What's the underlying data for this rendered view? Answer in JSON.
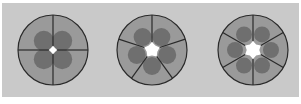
{
  "figure": {
    "panels": [
      {
        "label": "4-cell arrangement",
        "segments": 4,
        "cx": 53,
        "cy": 50,
        "r": 35,
        "lumen_r": 4,
        "nucleus_r": 10,
        "nucleus_dist": 13
      },
      {
        "label": "5-cell arrangement",
        "segments": 5,
        "cx": 152,
        "cy": 50,
        "r": 35,
        "lumen_r": 8,
        "nucleus_r": 9,
        "nucleus_dist": 16
      },
      {
        "label": "6-cell arrangement",
        "segments": 6,
        "cx": 253,
        "cy": 50,
        "r": 35,
        "lumen_r": 9,
        "nucleus_r": 8,
        "nucleus_dist": 18
      }
    ],
    "colors": {
      "background": "#c9c9c9",
      "cell_fill": "#9a9a9a",
      "nucleus_fill": "#6f6f6f",
      "outline": "#2a2a2a",
      "lumen": "#ffffff"
    }
  }
}
